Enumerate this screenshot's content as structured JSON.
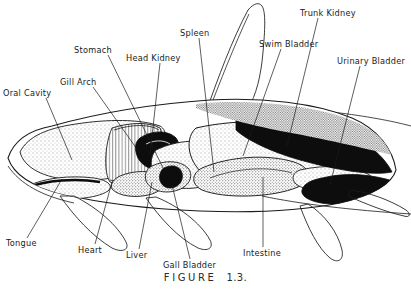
{
  "figure": {
    "caption_word": "FIGURE",
    "caption_number": "1.3.",
    "background_color": "#ffffff",
    "ink_color": "#1a1a1a"
  },
  "labels": [
    {
      "id": "oral-cavity",
      "text": "Oral Cavity",
      "x": 3,
      "y": 89,
      "anchor_x": 46,
      "anchor_y": 98,
      "target_x": 72,
      "target_y": 160
    },
    {
      "id": "gill-arch",
      "text": "Gill Arch",
      "x": 60,
      "y": 78,
      "anchor_x": 93,
      "anchor_y": 87,
      "target_x": 139,
      "target_y": 152
    },
    {
      "id": "stomach",
      "text": "Stomach",
      "x": 74,
      "y": 46,
      "anchor_x": 108,
      "anchor_y": 55,
      "target_x": 163,
      "target_y": 168
    },
    {
      "id": "head-kidney",
      "text": "Head Kidney",
      "x": 126,
      "y": 54,
      "anchor_x": 160,
      "anchor_y": 63,
      "target_x": 150,
      "target_y": 155
    },
    {
      "id": "spleen",
      "text": "Spleen",
      "x": 180,
      "y": 29,
      "anchor_x": 199,
      "anchor_y": 38,
      "target_x": 214,
      "target_y": 172
    },
    {
      "id": "swim-bladder",
      "text": "Swim Bladder",
      "x": 259,
      "y": 40,
      "anchor_x": 281,
      "anchor_y": 49,
      "target_x": 243,
      "target_y": 156
    },
    {
      "id": "trunk-kidney",
      "text": "Trunk Kidney",
      "x": 300,
      "y": 9,
      "anchor_x": 318,
      "anchor_y": 18,
      "target_x": 287,
      "target_y": 146
    },
    {
      "id": "urinary-bladder",
      "text": "Urinary Bladder",
      "x": 337,
      "y": 57,
      "anchor_x": 360,
      "anchor_y": 66,
      "target_x": 330,
      "target_y": 185
    },
    {
      "id": "tongue",
      "text": "Tongue",
      "x": 6,
      "y": 239,
      "anchor_x": 27,
      "anchor_y": 238,
      "target_x": 62,
      "target_y": 179
    },
    {
      "id": "heart",
      "text": "Heart",
      "x": 78,
      "y": 246,
      "anchor_x": 95,
      "anchor_y": 244,
      "target_x": 112,
      "target_y": 182
    },
    {
      "id": "liver",
      "text": "Liver",
      "x": 126,
      "y": 251,
      "anchor_x": 139,
      "anchor_y": 249,
      "target_x": 152,
      "target_y": 182
    },
    {
      "id": "gall-bladder",
      "text": "Gall Bladder",
      "x": 163,
      "y": 261,
      "anchor_x": 190,
      "anchor_y": 259,
      "target_x": 172,
      "target_y": 185
    },
    {
      "id": "intestine",
      "text": "Intestine",
      "x": 243,
      "y": 249,
      "anchor_x": 263,
      "anchor_y": 247,
      "target_x": 263,
      "target_y": 177
    }
  ],
  "organs": [
    {
      "id": "oral-cavity-mass",
      "name": "Oral Cavity",
      "fill": "stipple-light"
    },
    {
      "id": "gill-arch-mass",
      "name": "Gill Arch",
      "fill": "hatched"
    },
    {
      "id": "head-kidney-mass",
      "name": "Head Kidney",
      "fill": "solid-dark"
    },
    {
      "id": "stomach-mass",
      "name": "Stomach",
      "fill": "stipple-light"
    },
    {
      "id": "liver-mass",
      "name": "Liver",
      "fill": "stipple-mid"
    },
    {
      "id": "heart-mass",
      "name": "Heart",
      "fill": "stipple-mid"
    },
    {
      "id": "gall-bladder-mass",
      "name": "Gall Bladder",
      "fill": "solid-dark"
    },
    {
      "id": "swim-bladder-mass",
      "name": "Swim Bladder",
      "fill": "stipple-light"
    },
    {
      "id": "intestine-mass",
      "name": "Intestine",
      "fill": "stipple-mid"
    },
    {
      "id": "trunk-kidney-mass",
      "name": "Trunk Kidney",
      "fill": "solid-dark"
    },
    {
      "id": "urinary-bladder-mass",
      "name": "Urinary Bladder",
      "fill": "stipple-light"
    },
    {
      "id": "tongue-mass",
      "name": "Tongue",
      "fill": "stipple-light"
    }
  ]
}
